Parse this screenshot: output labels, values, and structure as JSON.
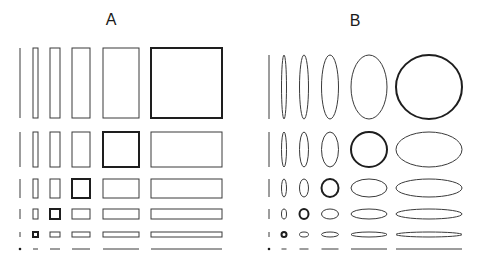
{
  "figure": {
    "stroke_color": "#3a3a3a",
    "thick_stroke_color": "#1e1e1e",
    "background": "#ffffff",
    "thin_stroke_width": 1,
    "thick_stroke_width": 2
  },
  "panels": [
    {
      "label": "A",
      "shape": "rectangle",
      "columns": [
        {
          "x": 20,
          "w": 0
        },
        {
          "x": 35.5,
          "w": 5
        },
        {
          "x": 55,
          "w": 10
        },
        {
          "x": 81,
          "w": 18
        },
        {
          "x": 121,
          "w": 36
        },
        {
          "x": 186.5,
          "w": 71
        }
      ],
      "rows": [
        {
          "y": 83,
          "h": 70
        },
        {
          "y": 149.5,
          "h": 35
        },
        {
          "y": 188.5,
          "h": 19
        },
        {
          "y": 214,
          "h": 10
        },
        {
          "y": 234.5,
          "h": 5
        },
        {
          "y": 249,
          "h": 0
        }
      ],
      "highlight_diagonal": [
        [
          0,
          5
        ],
        [
          1,
          4
        ],
        [
          2,
          3
        ],
        [
          3,
          2
        ],
        [
          4,
          1
        ],
        [
          5,
          0
        ]
      ]
    },
    {
      "label": "B",
      "shape": "ellipse",
      "columns": [
        {
          "x": 269,
          "w": 0
        },
        {
          "x": 284,
          "w": 5
        },
        {
          "x": 304,
          "w": 9
        },
        {
          "x": 330,
          "w": 17
        },
        {
          "x": 369,
          "w": 36
        },
        {
          "x": 429,
          "w": 66
        }
      ],
      "rows": [
        {
          "y": 87,
          "h": 64
        },
        {
          "y": 149.5,
          "h": 35
        },
        {
          "y": 188,
          "h": 18
        },
        {
          "y": 214,
          "h": 10
        },
        {
          "y": 234.5,
          "h": 5
        },
        {
          "y": 249,
          "h": 0
        }
      ],
      "highlight_diagonal": [
        [
          0,
          5
        ],
        [
          1,
          4
        ],
        [
          2,
          3
        ],
        [
          3,
          2
        ],
        [
          4,
          1
        ],
        [
          5,
          0
        ]
      ]
    }
  ]
}
